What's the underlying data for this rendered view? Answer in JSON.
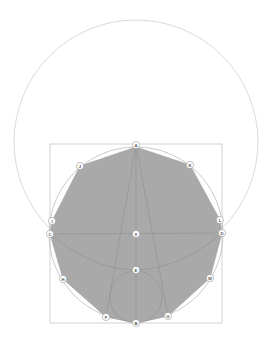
{
  "diagram": {
    "colors": {
      "background": "#ffffff",
      "polygon_fill": "#a9a9a9",
      "construction_line": "#8a8a8a",
      "outer_circle": "#cfcfcf",
      "square": "#c8c8c8",
      "label_circle_fill": "#ffffff",
      "label_circle_stroke": "#9a9a9a",
      "label_text": "#555555"
    },
    "points": [
      {
        "id": "A",
        "label": "A",
        "x": 136,
        "y": 145
      },
      {
        "id": "B",
        "label": "B",
        "x": 136,
        "y": 323
      },
      {
        "id": "C",
        "label": "C",
        "x": 50,
        "y": 234
      },
      {
        "id": "D",
        "label": "D",
        "x": 222,
        "y": 233
      },
      {
        "id": "X",
        "label": "X",
        "x": 136,
        "y": 234
      },
      {
        "id": "E",
        "label": "E",
        "x": 136,
        "y": 270
      },
      {
        "id": "F",
        "label": "F",
        "x": 106,
        "y": 317
      },
      {
        "id": "G",
        "label": "G",
        "x": 168,
        "y": 316
      },
      {
        "id": "H",
        "label": "H",
        "x": 63,
        "y": 279
      },
      {
        "id": "M",
        "label": "M",
        "x": 210,
        "y": 278
      },
      {
        "id": "I",
        "label": "I",
        "x": 52,
        "y": 221
      },
      {
        "id": "L",
        "label": "L",
        "x": 220,
        "y": 220
      },
      {
        "id": "J",
        "label": "J",
        "x": 80,
        "y": 166
      },
      {
        "id": "K",
        "label": "K",
        "x": 190,
        "y": 165
      }
    ]
  }
}
